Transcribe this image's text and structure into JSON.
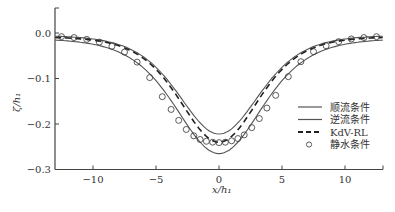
{
  "chart_data": {
    "type": "line",
    "title": "",
    "xlabel": "x/h1",
    "ylabel": "ζ/h1",
    "xlim": [
      -13,
      13
    ],
    "ylim": [
      -0.3,
      0.05
    ],
    "x_ticks": [
      -10,
      -5,
      0,
      5,
      10
    ],
    "x_tick_labels": [
      "−10",
      "−5",
      "0",
      "5",
      "10"
    ],
    "y_ticks": [
      0.0,
      -0.1,
      -0.2,
      -0.3
    ],
    "y_tick_labels": [
      "0.0",
      "−0.1",
      "−0.2",
      "−0.3"
    ],
    "grid": false,
    "legend_position": "lower right",
    "series": [
      {
        "name": "顺流条件",
        "style": "solid",
        "color": "#555555",
        "amplitude": -0.265,
        "width": 4.6,
        "offset": -0.012
      },
      {
        "name": "逆流条件",
        "style": "solid",
        "color": "#555555",
        "amplitude": -0.222,
        "width": 4.3,
        "offset": -0.005
      },
      {
        "name": "KdV-RL",
        "style": "dashed",
        "color": "#222222",
        "amplitude": -0.24,
        "width": 4.2,
        "offset": -0.008
      },
      {
        "name": "静水条件",
        "style": "circle-markers",
        "color": "#333333",
        "x": [
          -12.5,
          -11.5,
          -10.5,
          -9.5,
          -8.5,
          -7.5,
          -6.5,
          -5.5,
          -4.5,
          -3.8,
          -3.2,
          -2.6,
          -2.0,
          -1.5,
          -1.0,
          -0.5,
          0.0,
          0.5,
          1.0,
          1.5,
          2.0,
          2.6,
          3.2,
          3.8,
          4.5,
          5.5,
          6.5,
          7.5,
          8.5,
          9.5,
          10.5,
          11.5,
          12.5
        ],
        "y": [
          -0.008,
          -0.01,
          -0.014,
          -0.02,
          -0.029,
          -0.042,
          -0.064,
          -0.098,
          -0.14,
          -0.168,
          -0.192,
          -0.212,
          -0.226,
          -0.234,
          -0.238,
          -0.24,
          -0.241,
          -0.24,
          -0.237,
          -0.232,
          -0.224,
          -0.208,
          -0.188,
          -0.165,
          -0.137,
          -0.096,
          -0.063,
          -0.041,
          -0.028,
          -0.019,
          -0.013,
          -0.01,
          -0.008
        ]
      }
    ]
  },
  "axes": {
    "xlabel": "x/h₁",
    "ylabel": "ζ/h₁"
  },
  "legend": {
    "items": [
      {
        "label": "顺流条件"
      },
      {
        "label": "逆流条件"
      },
      {
        "label": "KdV-RL"
      },
      {
        "label": "静水条件"
      }
    ]
  }
}
